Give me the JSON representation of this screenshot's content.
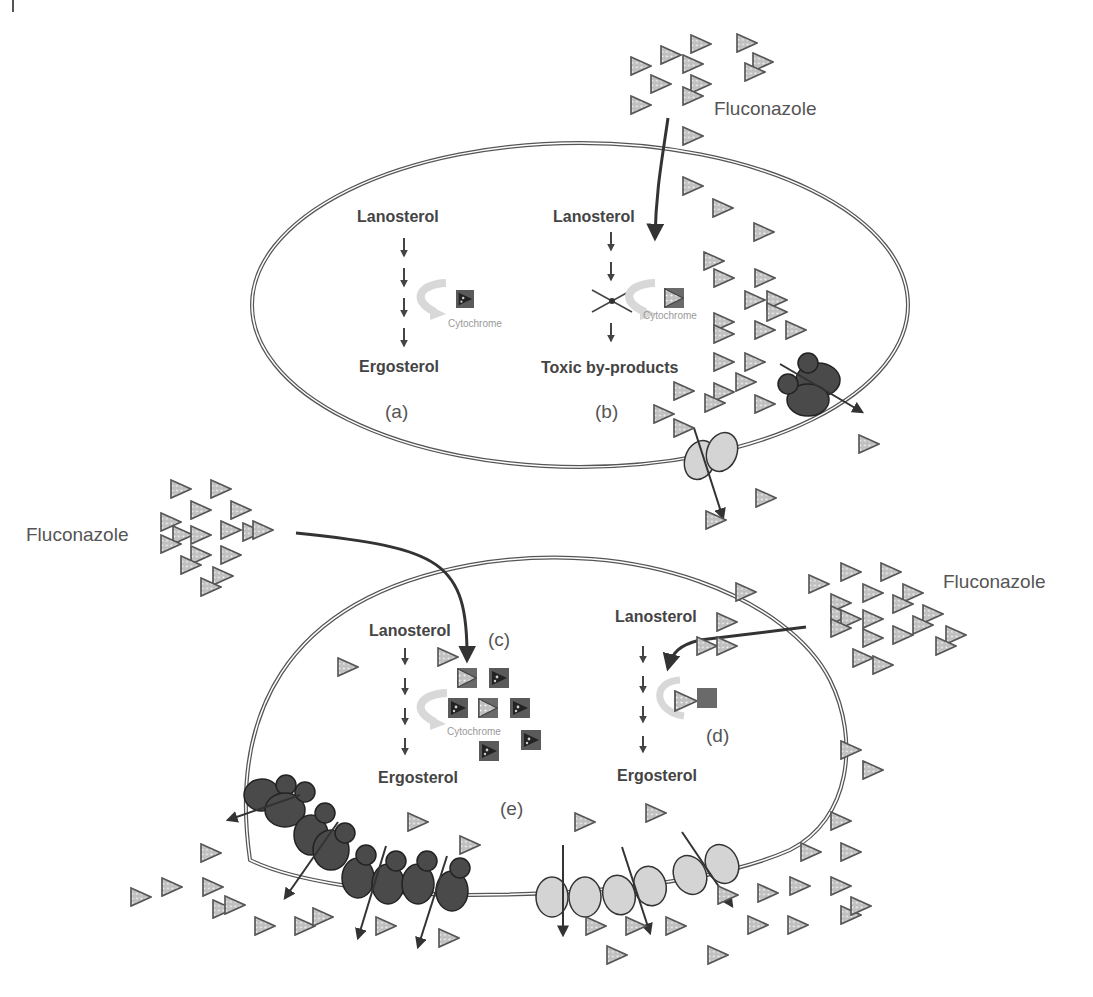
{
  "figure": {
    "drug_label": "Fluconazole",
    "cells": [
      {
        "name": "top-cell",
        "panels": [
          {
            "id": "a",
            "label": "(a)",
            "start": "Lanosterol",
            "end": "Ergosterol",
            "enzyme": "Cytochrome",
            "state": "normal"
          },
          {
            "id": "b",
            "label": "(b)",
            "start": "Lanosterol",
            "end": "Toxic by-products",
            "enzyme": "Cytochrome",
            "state": "inhibited"
          }
        ]
      },
      {
        "name": "bottom-cell",
        "panels": [
          {
            "id": "c",
            "label": "(c)",
            "start": "Lanosterol",
            "end": "Ergosterol",
            "enzyme": "Cytochrome",
            "state": "overexpressed-target"
          },
          {
            "id": "d",
            "label": "(d)",
            "start": "Lanosterol",
            "end": "Ergosterol",
            "enzyme": "",
            "state": "altered-target"
          },
          {
            "id": "e",
            "label": "(e)",
            "state": "efflux-pump-upregulation"
          }
        ]
      }
    ],
    "legend_colors": {
      "drug_fill": "#c8c8c8",
      "drug_stroke": "#555555",
      "pump_dark": "#4a4a4a",
      "pump_light": "#d4d4d4",
      "enzyme": "#5a5a5a",
      "membrane": "#555555"
    }
  }
}
